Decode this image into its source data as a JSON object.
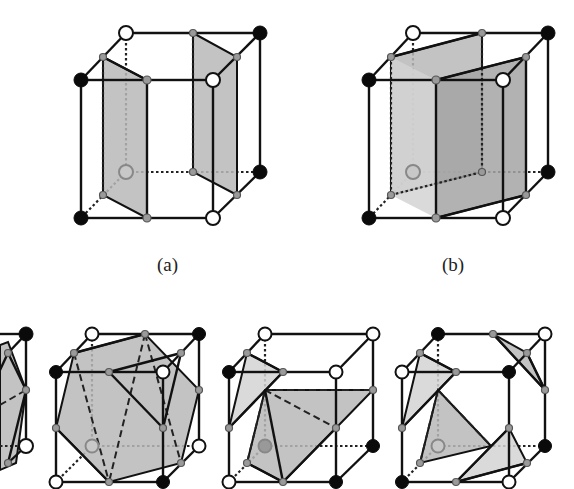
{
  "figure": {
    "type": "marching-cubes-ambiguous-cases",
    "labels": {
      "a": "(a)",
      "b": "(b)"
    },
    "top_row": [
      {
        "id": "a",
        "label": "(a)",
        "description": "two separate quadrilateral surfaces"
      },
      {
        "id": "b",
        "label": "(b)",
        "description": "connected tunnel-like surface"
      }
    ],
    "bottom_row": [
      {
        "id": "c1",
        "label": "",
        "description": "partially visible cube (cut off left edge)"
      },
      {
        "id": "c2",
        "label": "",
        "description": "large hexagon-like polygon with triangulation"
      },
      {
        "id": "c3",
        "label": "",
        "description": "triangle plus fan of triangles"
      },
      {
        "id": "c4",
        "label": "",
        "description": "four separated triangles"
      }
    ],
    "colors": {
      "background": "#ffffff",
      "edge": "#111111",
      "surface": "#b8b8b8",
      "vertex_inside": "#0a0a0a",
      "vertex_outside": "#ffffff",
      "edge_midpoint": "#9a9a9a"
    }
  }
}
